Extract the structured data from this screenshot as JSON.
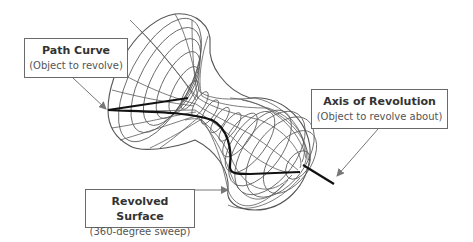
{
  "diagram": {
    "colors": {
      "background": "#ffffff",
      "wireframe": "#5a5a5a",
      "path_curve": "#111111",
      "axis": "#111111",
      "leader": "#777777",
      "callout_border": "#6a6a6a",
      "text": "#333333"
    },
    "callouts": [
      {
        "id": "path-curve",
        "title": "Path Curve",
        "subtitle": "(Object to revolve)"
      },
      {
        "id": "axis-of-revolution",
        "title": "Axis of Revolution",
        "subtitle": "(Object to revolve about)"
      },
      {
        "id": "revolved-surface",
        "title": "Revolved Surface",
        "subtitle": "(360-degree sweep)"
      }
    ]
  }
}
